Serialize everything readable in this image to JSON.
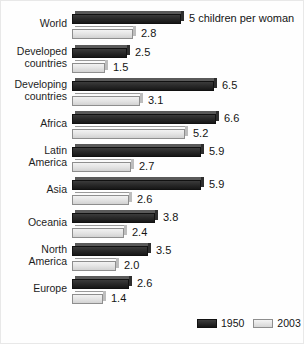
{
  "chart_data": {
    "type": "bar",
    "orientation": "horizontal",
    "title": "",
    "subtitle": "",
    "xlabel": "",
    "ylabel": "",
    "xlim": [
      0,
      6.6
    ],
    "grid": false,
    "legend_position": "bottom-right",
    "categories": [
      "World",
      "Developed\ncountries",
      "Developing\ncountries",
      "Africa",
      "Latin\nAmerica",
      "Asia",
      "Oceania",
      "North\nAmerica",
      "Europe"
    ],
    "series": [
      {
        "name": "1950",
        "color": "#1f1f1f",
        "values": [
          5.0,
          2.5,
          6.5,
          6.6,
          5.9,
          5.9,
          3.8,
          3.5,
          2.6
        ],
        "labels": [
          "5 children per woman",
          "2.5",
          "6.5",
          "6.6",
          "5.9",
          "5.9",
          "3.8",
          "3.5",
          "2.6"
        ]
      },
      {
        "name": "2003",
        "color": "#e2e2e2",
        "values": [
          2.8,
          1.5,
          3.1,
          5.2,
          2.7,
          2.6,
          2.4,
          2.0,
          1.4
        ],
        "labels": [
          "2.8",
          "1.5",
          "3.1",
          "5.2",
          "2.7",
          "2.6",
          "2.4",
          "2.0",
          "1.4"
        ]
      }
    ]
  },
  "legend": {
    "items": [
      {
        "label": "1950",
        "swatch": "dark"
      },
      {
        "label": "2003",
        "swatch": "light"
      }
    ]
  }
}
